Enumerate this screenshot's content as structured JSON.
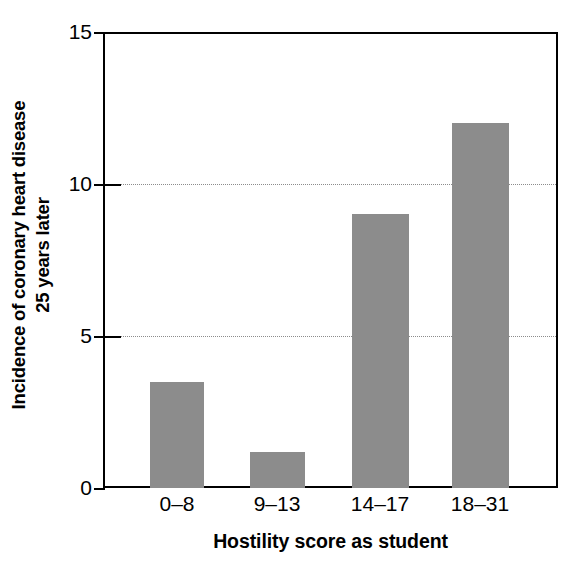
{
  "chart_data": {
    "type": "bar",
    "title": "",
    "xlabel": "Hostility score as student",
    "ylabel": "Incidence of coronary heart disease 25 years later",
    "ylabel_line1": "Incidence of coronary heart disease",
    "ylabel_line2": "25 years later",
    "categories": [
      "0–8",
      "9–13",
      "14–17",
      "18–31"
    ],
    "values": [
      3.5,
      1.2,
      9.0,
      12.0
    ],
    "ylim": [
      0,
      15
    ],
    "yticks": [
      0,
      5,
      10,
      15
    ],
    "ytick_labels": [
      "0",
      "5",
      "10",
      "15"
    ],
    "gridlines": [
      5,
      10
    ],
    "grid": "horizontal-dotted-at-5-and-10",
    "legend": "none",
    "bar_color": "#8c8c8c",
    "axis_color": "#000000",
    "grid_color": "#8c8c8c",
    "background_color": "#ffffff",
    "series": [
      {
        "name": "Incidence of coronary heart disease 25 years later",
        "values": [
          3.5,
          1.2,
          9.0,
          12.0
        ]
      }
    ],
    "bars": [
      {
        "category": "0–8",
        "value": 3.5
      },
      {
        "category": "9–13",
        "value": 1.2
      },
      {
        "category": "14–17",
        "value": 9.0
      },
      {
        "category": "18–31",
        "value": 12.0
      }
    ]
  }
}
